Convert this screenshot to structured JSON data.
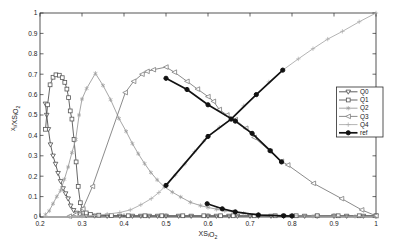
{
  "chart_data": {
    "type": "line",
    "title": "",
    "xlabel_rich": [
      [
        "XS",
        false
      ],
      [
        "i",
        true
      ],
      [
        "O",
        false
      ],
      [
        "2",
        true
      ]
    ],
    "ylabel_rich": [
      [
        "x",
        false
      ],
      [
        "i",
        true
      ],
      [
        "/XS",
        false
      ],
      [
        "i",
        true
      ],
      [
        "O",
        false
      ],
      [
        "2",
        true
      ]
    ],
    "xlim": [
      0.2,
      1.0
    ],
    "ylim": [
      0.0,
      1.0
    ],
    "grid": false,
    "frame_color": "#2a2a2a",
    "xticks": {
      "values": [
        0.2,
        0.3,
        0.4,
        0.5,
        0.6,
        0.7,
        0.8,
        0.9,
        1.0
      ],
      "labels": [
        "0.2",
        "0.3",
        "0.4",
        "0.5",
        "0.6",
        "0.7",
        "0.8",
        "0.9",
        "1"
      ]
    },
    "yticks": {
      "values": [
        0,
        0.1,
        0.2,
        0.3,
        0.4,
        0.5,
        0.6,
        0.7,
        0.8,
        0.9,
        1.0
      ],
      "labels": [
        "0",
        "0.1",
        "0.2",
        "0.3",
        "0.4",
        "0.5",
        "0.6",
        "0.7",
        "0.8",
        "0.9",
        "1"
      ]
    },
    "legend": {
      "position": "right",
      "labels": [
        "Q0",
        "Q1",
        "Q2",
        "Q3",
        "Q4",
        "ref"
      ]
    },
    "series": [
      {
        "name": "Q0",
        "marker": "triangle-down",
        "color": "#4d4d4d",
        "width": 0.9,
        "segments": [
          [
            [
              0.213,
              0.555
            ],
            [
              0.216,
              0.5
            ],
            [
              0.22,
              0.43
            ],
            [
              0.225,
              0.355
            ],
            [
              0.231,
              0.3
            ],
            [
              0.237,
              0.26
            ],
            [
              0.243,
              0.215
            ],
            [
              0.249,
              0.175
            ],
            [
              0.255,
              0.14
            ],
            [
              0.261,
              0.115
            ],
            [
              0.267,
              0.09
            ],
            [
              0.273,
              0.055
            ],
            [
              0.28,
              0.033
            ],
            [
              0.287,
              0.02
            ],
            [
              0.295,
              0.012
            ],
            [
              0.31,
              0.008
            ],
            [
              0.33,
              0.006
            ],
            [
              0.36,
              0.005
            ],
            [
              0.39,
              0.005
            ],
            [
              0.42,
              0.005
            ],
            [
              0.44,
              0.005
            ],
            [
              0.46,
              0.005
            ],
            [
              0.48,
              0.005
            ],
            [
              0.5,
              0.005
            ],
            [
              0.53,
              0.005
            ],
            [
              0.56,
              0.005
            ],
            [
              0.6,
              0.005
            ],
            [
              0.62,
              0.005
            ],
            [
              0.65,
              0.005
            ],
            [
              0.67,
              0.005
            ],
            [
              0.7,
              0.005
            ],
            [
              0.72,
              0.005
            ],
            [
              0.75,
              0.005
            ],
            [
              0.78,
              0.005
            ],
            [
              0.8,
              0.005
            ],
            [
              0.83,
              0.005
            ],
            [
              0.86,
              0.005
            ],
            [
              0.9,
              0.005
            ],
            [
              0.93,
              0.005
            ],
            [
              0.97,
              0.005
            ],
            [
              1,
              0.005
            ]
          ]
        ]
      },
      {
        "name": "Q1",
        "marker": "square",
        "color": "#565656",
        "width": 0.9,
        "segments": [
          [
            [
              0.213,
              0.43
            ],
            [
              0.218,
              0.55
            ],
            [
              0.224,
              0.648
            ],
            [
              0.231,
              0.685
            ],
            [
              0.238,
              0.697
            ],
            [
              0.246,
              0.695
            ],
            [
              0.253,
              0.683
            ],
            [
              0.259,
              0.66
            ],
            [
              0.264,
              0.627
            ],
            [
              0.268,
              0.585
            ],
            [
              0.272,
              0.52
            ],
            [
              0.276,
              0.48
            ],
            [
              0.281,
              0.38
            ],
            [
              0.286,
              0.27
            ],
            [
              0.291,
              0.15
            ],
            [
              0.296,
              0.07
            ],
            [
              0.302,
              0.035
            ],
            [
              0.31,
              0.02
            ],
            [
              0.32,
              0.013
            ],
            [
              0.34,
              0.009
            ],
            [
              0.37,
              0.007
            ],
            [
              0.41,
              0.006
            ],
            [
              0.45,
              0.006
            ],
            [
              0.49,
              0.006
            ],
            [
              0.54,
              0.006
            ],
            [
              0.59,
              0.006
            ],
            [
              0.63,
              0.006
            ],
            [
              0.66,
              0.006
            ],
            [
              0.71,
              0.006
            ],
            [
              0.76,
              0.006
            ],
            [
              0.81,
              0.006
            ],
            [
              0.86,
              0.006
            ],
            [
              0.91,
              0.006
            ],
            [
              0.96,
              0.006
            ],
            [
              1,
              0.006
            ]
          ]
        ]
      },
      {
        "name": "Q2",
        "marker": "asterisk",
        "color": "#9c9c9c",
        "width": 0.9,
        "segments": [
          [
            [
              0.213,
              0.012
            ],
            [
              0.222,
              0.03
            ],
            [
              0.231,
              0.065
            ],
            [
              0.24,
              0.1
            ],
            [
              0.249,
              0.13
            ],
            [
              0.258,
              0.185
            ],
            [
              0.267,
              0.245
            ],
            [
              0.276,
              0.315
            ],
            [
              0.285,
              0.38
            ],
            [
              0.293,
              0.5
            ],
            [
              0.3,
              0.578
            ],
            [
              0.311,
              0.63
            ],
            [
              0.332,
              0.704
            ],
            [
              0.35,
              0.645
            ],
            [
              0.368,
              0.575
            ],
            [
              0.388,
              0.483
            ],
            [
              0.405,
              0.42
            ],
            [
              0.42,
              0.36
            ],
            [
              0.434,
              0.31
            ],
            [
              0.449,
              0.262
            ],
            [
              0.464,
              0.218
            ],
            [
              0.479,
              0.182
            ],
            [
              0.496,
              0.148
            ],
            [
              0.515,
              0.122
            ],
            [
              0.535,
              0.098
            ],
            [
              0.558,
              0.072
            ],
            [
              0.582,
              0.056
            ],
            [
              0.6,
              0.047
            ],
            [
              0.62,
              0.038
            ],
            [
              0.64,
              0.031
            ],
            [
              0.66,
              0.026
            ],
            [
              0.685,
              0.018
            ],
            [
              0.72,
              0.012
            ],
            [
              0.76,
              0.008
            ],
            [
              0.8,
              0.006
            ],
            [
              0.85,
              0.004
            ],
            [
              0.9,
              0.003
            ],
            [
              0.95,
              0.003
            ],
            [
              1,
              0.002
            ]
          ]
        ]
      },
      {
        "name": "Q3",
        "marker": "triangle-left",
        "color": "#7e7e7e",
        "width": 0.9,
        "segments": [
          [
            [
              0.27,
              0.004
            ],
            [
              0.285,
              0.012
            ],
            [
              0.302,
              0.04
            ],
            [
              0.325,
              0.15
            ],
            [
              0.403,
              0.61
            ],
            [
              0.423,
              0.665
            ],
            [
              0.443,
              0.7
            ],
            [
              0.455,
              0.714
            ],
            [
              0.47,
              0.722
            ],
            [
              0.5,
              0.735
            ],
            [
              0.52,
              0.71
            ],
            [
              0.55,
              0.665
            ],
            [
              0.575,
              0.627
            ],
            [
              0.6,
              0.59
            ],
            [
              0.613,
              0.567
            ],
            [
              0.627,
              0.527
            ],
            [
              0.645,
              0.5
            ],
            [
              0.665,
              0.477
            ],
            [
              0.69,
              0.435
            ],
            [
              0.71,
              0.39
            ],
            [
              0.748,
              0.322
            ],
            [
              0.775,
              0.273
            ],
            [
              0.79,
              0.255
            ],
            [
              0.851,
              0.165
            ],
            [
              0.918,
              0.09
            ],
            [
              0.966,
              0.035
            ],
            [
              1,
              0.006
            ]
          ]
        ]
      },
      {
        "name": "Q4",
        "marker": "plus",
        "color": "#ababab",
        "width": 0.9,
        "segments": [
          [
            [
              0.27,
              0.002
            ],
            [
              0.3,
              0.004
            ],
            [
              0.33,
              0.008
            ],
            [
              0.36,
              0.014
            ],
            [
              0.39,
              0.022
            ],
            [
              0.415,
              0.035
            ],
            [
              0.44,
              0.06
            ],
            [
              0.465,
              0.09
            ],
            [
              0.483,
              0.12
            ],
            [
              0.5,
              0.155
            ],
            [
              0.522,
              0.205
            ],
            [
              0.545,
              0.26
            ],
            [
              0.568,
              0.32
            ],
            [
              0.59,
              0.372
            ],
            [
              0.6,
              0.395
            ],
            [
              0.627,
              0.44
            ],
            [
              0.655,
              0.48
            ],
            [
              0.685,
              0.545
            ],
            [
              0.715,
              0.6
            ],
            [
              0.745,
              0.662
            ],
            [
              0.778,
              0.72
            ],
            [
              0.815,
              0.775
            ],
            [
              0.85,
              0.825
            ],
            [
              0.885,
              0.872
            ],
            [
              0.92,
              0.91
            ],
            [
              0.96,
              0.957
            ],
            [
              1,
              1
            ]
          ]
        ]
      },
      {
        "name": "ref",
        "marker": "circle-filled",
        "color": "#121212",
        "width": 1.7,
        "segments": [
          [
            [
              0.5,
              0.155
            ],
            [
              0.6,
              0.395
            ],
            [
              0.655,
              0.48
            ],
            [
              0.715,
              0.6
            ],
            [
              0.778,
              0.72
            ]
          ],
          [
            [
              0.5,
              0.68
            ],
            [
              0.55,
              0.625
            ],
            [
              0.6,
              0.55
            ],
            [
              0.665,
              0.47
            ],
            [
              0.705,
              0.41
            ],
            [
              0.748,
              0.325
            ],
            [
              0.775,
              0.27
            ]
          ],
          [
            [
              0.598,
              0.065
            ],
            [
              0.634,
              0.04
            ],
            [
              0.665,
              0.025
            ],
            [
              0.72,
              0.01
            ],
            [
              0.78,
              0.006
            ],
            [
              0.8,
              0.005
            ]
          ]
        ]
      }
    ],
    "plot_box": {
      "left": 40,
      "right": 376,
      "top": 13,
      "bottom": 217
    },
    "legend_box": {
      "x": 336.5,
      "y": 87,
      "w": 46.5,
      "h": 50
    }
  }
}
